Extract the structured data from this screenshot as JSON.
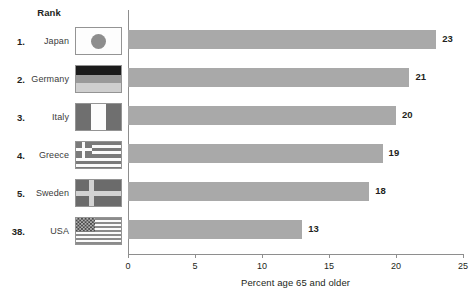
{
  "table": {
    "rank_header": "Rank",
    "rows": [
      {
        "rank": "1.",
        "country": "Japan",
        "flag": "flag-japan-icon"
      },
      {
        "rank": "2.",
        "country": "Germany",
        "flag": "flag-germany-icon"
      },
      {
        "rank": "3.",
        "country": "Italy",
        "flag": "flag-italy-icon"
      },
      {
        "rank": "4.",
        "country": "Greece",
        "flag": "flag-greece-icon"
      },
      {
        "rank": "5.",
        "country": "Sweden",
        "flag": "flag-sweden-icon"
      },
      {
        "rank": "38.",
        "country": "USA",
        "flag": "flag-usa-icon"
      }
    ]
  },
  "colors": {
    "bar": "#a9a9a9",
    "axis": "#8e8e8e",
    "text": "#231f20",
    "background": "#ffffff"
  },
  "chart_data": {
    "type": "bar",
    "orientation": "horizontal",
    "title": "",
    "xlabel": "Percent age 65 and older",
    "ylabel": "",
    "categories": [
      "Japan",
      "Germany",
      "Italy",
      "Greece",
      "Sweden",
      "USA"
    ],
    "values": [
      23,
      21,
      20,
      19,
      18,
      13
    ],
    "data_labels": [
      "23",
      "21",
      "20",
      "19",
      "18",
      "13"
    ],
    "xlim": [
      0,
      25
    ],
    "xticks": [
      0,
      5,
      10,
      15,
      20,
      25
    ],
    "xtick_labels": [
      "0",
      "5",
      "10",
      "15",
      "20",
      "25"
    ],
    "grid": false,
    "legend": false
  }
}
